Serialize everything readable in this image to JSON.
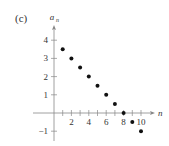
{
  "chart_data": {
    "type": "scatter",
    "panel_label": "(c)",
    "title": "",
    "xlabel": "n",
    "ylabel": "a",
    "ylabel_subscript": "n",
    "xlim": [
      -2,
      11.5
    ],
    "ylim": [
      -1.6,
      4.8
    ],
    "x_ticks": [
      1,
      2,
      3,
      4,
      5,
      6,
      7,
      8,
      9,
      10
    ],
    "x_tick_labels": [
      {
        "value": 2,
        "label": "2"
      },
      {
        "value": 4,
        "label": "4"
      },
      {
        "value": 6,
        "label": "6"
      },
      {
        "value": 8,
        "label": "8"
      },
      {
        "value": 10,
        "label": "10"
      }
    ],
    "y_ticks": [
      {
        "value": 4,
        "label": "4"
      },
      {
        "value": 3,
        "label": "3"
      },
      {
        "value": 2,
        "label": "2"
      },
      {
        "value": 1,
        "label": "1"
      },
      {
        "value": -1,
        "label": "−1"
      }
    ],
    "grid": false,
    "legend": null,
    "series": [
      {
        "name": "a_n",
        "x": [
          1,
          2,
          3,
          4,
          5,
          6,
          7,
          8,
          9,
          10
        ],
        "y": [
          3.5,
          3,
          2.5,
          2,
          1.5,
          1,
          0.5,
          0,
          -0.5,
          -1
        ]
      }
    ],
    "colors": {
      "axis": "#888888",
      "points": "#111111",
      "text": "#333333"
    }
  }
}
